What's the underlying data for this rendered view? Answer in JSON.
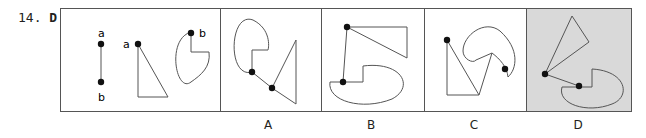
{
  "question": {
    "number": "14.",
    "answer": "D"
  },
  "stem": {
    "labels": [
      "a",
      "b",
      "a",
      "b"
    ]
  },
  "options": [
    {
      "label": "A",
      "highlighted": false
    },
    {
      "label": "B",
      "highlighted": false
    },
    {
      "label": "C",
      "highlighted": false
    },
    {
      "label": "D",
      "highlighted": true
    }
  ],
  "colors": {
    "highlight": "#d9d9d9",
    "line": "#555555",
    "dot": "#111111"
  }
}
